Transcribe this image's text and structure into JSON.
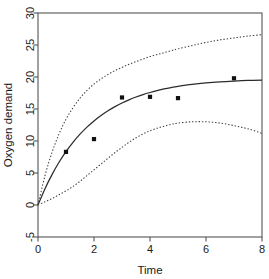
{
  "chart_data": {
    "type": "line",
    "title": "",
    "xlabel": "Time",
    "ylabel": "Oxygen demand",
    "xlim": [
      0,
      8
    ],
    "ylim": [
      -5,
      30
    ],
    "xticks": [
      0,
      2,
      4,
      6,
      8
    ],
    "xtick_labels": [
      "0",
      "2",
      "4",
      "6",
      "8"
    ],
    "yticks": [
      -5,
      0,
      5,
      10,
      15,
      20,
      25,
      30
    ],
    "ytick_labels": [
      "-5",
      "0",
      "5",
      "10",
      "15",
      "20",
      "25",
      "30"
    ],
    "grid": false,
    "legend": "none",
    "box": true,
    "series": [
      {
        "name": "fitted",
        "style": "solid",
        "x": [
          0,
          0.25,
          0.5,
          0.75,
          1,
          1.25,
          1.5,
          1.75,
          2,
          2.25,
          2.5,
          2.75,
          3,
          3.25,
          3.5,
          3.75,
          4,
          4.25,
          4.5,
          4.75,
          5,
          5.5,
          6,
          6.5,
          7,
          7.5,
          8
        ],
        "values": [
          0,
          2.55,
          4.75,
          6.68,
          8.35,
          9.8,
          11.07,
          12.17,
          13.14,
          13.98,
          14.72,
          15.37,
          15.94,
          16.43,
          16.87,
          17.25,
          17.58,
          17.87,
          18.13,
          18.35,
          18.54,
          18.85,
          19.08,
          19.25,
          19.37,
          19.46,
          19.52
        ]
      },
      {
        "name": "upper-confidence-band",
        "style": "dotted",
        "x": [
          0,
          0.25,
          0.5,
          0.75,
          1,
          1.25,
          1.5,
          1.75,
          2,
          2.25,
          2.5,
          2.75,
          3,
          3.25,
          3.5,
          3.75,
          4,
          4.25,
          4.5,
          4.75,
          5,
          5.5,
          6,
          6.5,
          7,
          7.5,
          8
        ],
        "values": [
          0,
          4.6,
          8.2,
          11.1,
          13.4,
          15.2,
          16.7,
          17.9,
          18.9,
          19.7,
          20.4,
          21.0,
          21.5,
          22.0,
          22.4,
          22.8,
          23.2,
          23.5,
          23.8,
          24.1,
          24.4,
          24.9,
          25.4,
          25.8,
          26.1,
          26.4,
          26.6
        ]
      },
      {
        "name": "lower-confidence-band",
        "style": "dotted",
        "x": [
          0,
          0.25,
          0.5,
          0.75,
          1,
          1.25,
          1.5,
          1.75,
          2,
          2.25,
          2.5,
          2.75,
          3,
          3.25,
          3.5,
          3.75,
          4,
          4.25,
          4.5,
          4.75,
          5,
          5.5,
          6,
          6.5,
          7,
          7.5,
          8
        ],
        "values": [
          0,
          0.5,
          1.0,
          1.6,
          2.2,
          2.9,
          3.7,
          4.6,
          5.5,
          6.4,
          7.3,
          8.2,
          9.0,
          9.8,
          10.5,
          11.1,
          11.6,
          12.0,
          12.3,
          12.6,
          12.8,
          13.0,
          13.0,
          12.8,
          12.4,
          11.9,
          11.2
        ]
      }
    ],
    "points": {
      "name": "observed",
      "marker": "square",
      "x": [
        1,
        2,
        3,
        4,
        5,
        7
      ],
      "y": [
        8.3,
        10.3,
        16.8,
        16.9,
        16.7,
        19.8
      ]
    }
  }
}
